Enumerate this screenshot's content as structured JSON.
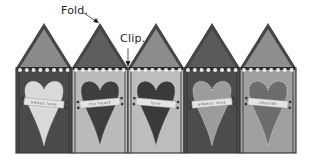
{
  "labels": {
    "fold": "Fold.",
    "clip": "Clip."
  },
  "panels": [
    {
      "roof": "#8a8a8a",
      "body": "#4a4a4a",
      "heart": "#d9d9d9",
      "banner_text": "sweet love"
    },
    {
      "roof": "#5e5e5e",
      "body": "#bababa",
      "heart": "#3e3e3e",
      "banner_text": "my heart"
    },
    {
      "roof": "#8c8c8c",
      "body": "#bdbdbd",
      "heart": "#3a3a3a",
      "banner_text": "love"
    },
    {
      "roof": "#5a5a5a",
      "body": "#4c4c4c",
      "heart": "#9c9c9c",
      "banner_text": "always love"
    },
    {
      "roof": "#8e8e8e",
      "body": "#a0a0a0",
      "heart": "#6c6c6c",
      "banner_text": "cherish"
    }
  ],
  "colors": {
    "outline": "#3a3a3a",
    "trim": "#e8e8e8",
    "banner": "#e4e4e4",
    "brad": "#333333"
  }
}
